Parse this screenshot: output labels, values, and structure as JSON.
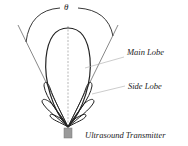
{
  "diagram": {
    "angle_symbol": "θ",
    "labels": {
      "main_lobe": "Main Lobe",
      "side_lobe": "Side Lobe",
      "transmitter": "Ultrasound Transmitter"
    },
    "colors": {
      "stroke": "#222222",
      "thin_line": "#555555",
      "leader": "#aaaaaa",
      "transmitter_fill": "#9a9a9a"
    }
  }
}
